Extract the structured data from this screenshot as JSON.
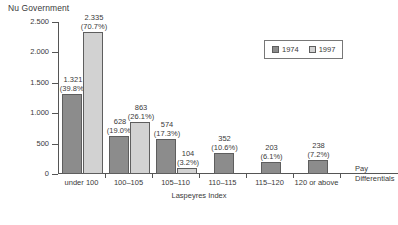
{
  "chart_data": {
    "type": "bar",
    "title": "Nu Government",
    "xlabel": "Laspeyres Index",
    "ylabel": "",
    "ylim": [
      0,
      2500
    ],
    "ytick_labels": [
      "0",
      "500",
      "1.000",
      "1.500",
      "2.000",
      "2.500"
    ],
    "ytick_values": [
      0,
      500,
      1000,
      1500,
      2000,
      2500
    ],
    "grid": false,
    "legend_position": "top-right",
    "categories": [
      "under 100",
      "100–105",
      "105–110",
      "110–115",
      "115–120",
      "120 or above"
    ],
    "series": [
      {
        "name": "1974",
        "color": "#8c8c8c",
        "values": [
          1321,
          628,
          574,
          352,
          203,
          238
        ],
        "value_labels": [
          "1.321",
          "628",
          "574",
          "352",
          "203",
          "238"
        ],
        "percent_labels": [
          "(39.8%)",
          "(19.0%)",
          "(17.3%)",
          "(10.6%)",
          "(6.1%)",
          "(7.2%)"
        ]
      },
      {
        "name": "1997",
        "color": "#d2d2d2",
        "values": [
          2335,
          863,
          104,
          null,
          null,
          null
        ],
        "value_labels": [
          "2.335",
          "863",
          "104",
          "",
          "",
          ""
        ],
        "percent_labels": [
          "(70.7%)",
          "(26.1%)",
          "(3.2%)",
          "",
          "",
          ""
        ]
      }
    ],
    "annotations": [
      {
        "text_line1": "Pay",
        "text_line2": "Differentials"
      }
    ]
  },
  "legend": {
    "entries": [
      {
        "label": "1974"
      },
      {
        "label": "1997"
      }
    ]
  },
  "annotation": {
    "pay_line1": "Pay",
    "pay_line2": "Differentials"
  }
}
